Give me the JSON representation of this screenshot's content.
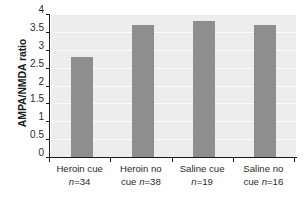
{
  "chart_data": {
    "type": "bar",
    "title": "",
    "xlabel": "",
    "ylabel": "AMPA/NMDA ratio",
    "categories": [
      "Heroin cue",
      "Heroin no cue",
      "Saline cue",
      "Saline no cue"
    ],
    "group_sizes": [
      34,
      38,
      19,
      16
    ],
    "values": [
      2.8,
      3.7,
      3.8,
      3.7
    ],
    "ylim": [
      0,
      4
    ],
    "ytick_values": [
      0,
      0.5,
      1,
      1.5,
      2,
      2.5,
      3,
      3.5,
      4
    ],
    "ytick_labels": [
      "0",
      "0.5",
      "1",
      "1.5",
      "2",
      "2.5",
      "3",
      "3.5",
      "4"
    ],
    "grid": true,
    "grid_axis": "y",
    "legend": false,
    "legend_position": "none",
    "bar_color": "#8e8e8e",
    "plot_background": "#ededed",
    "gridline_color": "#fbfbfb",
    "axis_color": "#1a1a1a"
  },
  "axes": {
    "y_title": "AMPA/NMDA ratio"
  },
  "x_category_labels": [
    {
      "line1": "Heroin cue",
      "n_prefix": "n",
      "n_value": "=34",
      "line2_text": ""
    },
    {
      "line1": "Heroin no",
      "n_prefix": "n",
      "n_value": "=38",
      "line2_text": "cue "
    },
    {
      "line1": "Saline cue",
      "n_prefix": "n",
      "n_value": "=19",
      "line2_text": ""
    },
    {
      "line1": "Saline no",
      "n_prefix": "n",
      "n_value": "=16",
      "line2_text": "cue "
    }
  ]
}
